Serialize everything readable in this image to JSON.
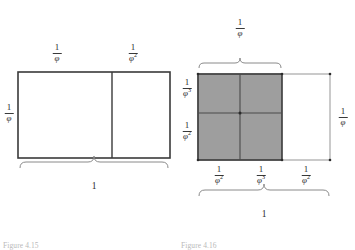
{
  "page": {
    "background_color": "#ffffff",
    "ink_color": "#2b2b2b",
    "shade_color": "#9e9e9e",
    "rule_color": "#3a3a3a",
    "thin_rule_color": "#8a8a8a"
  },
  "figure_left": {
    "caption": "Figure 4.15",
    "outer_width_label": {
      "numerator": "1",
      "denominator": ""
    },
    "labels": {
      "top_left": {
        "numerator": "1",
        "denominator": "φ",
        "exponent": ""
      },
      "top_right": {
        "numerator": "1",
        "denominator": "φ",
        "exponent": "2"
      },
      "left_side": {
        "numerator": "1",
        "denominator": "φ",
        "exponent": ""
      },
      "bottom_brace": "1"
    }
  },
  "figure_right": {
    "caption": "Figure 4.16",
    "labels": {
      "top_brace": {
        "numerator": "1",
        "denominator": "φ",
        "exponent": ""
      },
      "left_upper": {
        "numerator": "1",
        "denominator": "φ",
        "exponent": "3"
      },
      "left_lower": {
        "numerator": "1",
        "denominator": "φ",
        "exponent": "2"
      },
      "right_side": {
        "numerator": "1",
        "denominator": "φ",
        "exponent": ""
      },
      "bottom_first": {
        "numerator": "1",
        "denominator": "φ",
        "exponent": "2"
      },
      "bottom_second": {
        "numerator": "1",
        "denominator": "φ",
        "exponent": "3"
      },
      "bottom_third": {
        "numerator": "1",
        "denominator": "φ",
        "exponent": "2"
      },
      "bottom_brace": "1"
    }
  }
}
